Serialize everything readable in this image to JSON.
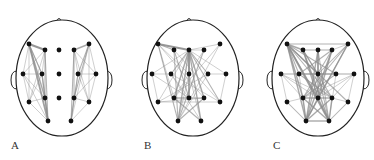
{
  "figure": {
    "panels": [
      {
        "label": "A",
        "label_pos": [
          11,
          139
        ],
        "head": {
          "cx": 62,
          "cy": 78,
          "rx": 46,
          "ry": 58,
          "nose": [
            59,
            19
          ],
          "ears": [
            [
              15,
              80
            ],
            [
              108,
              80
            ]
          ]
        },
        "electrodes": [
          [
            29,
            44
          ],
          [
            45,
            50
          ],
          [
            59,
            50
          ],
          [
            74,
            50
          ],
          [
            89,
            44
          ],
          [
            23,
            74
          ],
          [
            42,
            74
          ],
          [
            59,
            74
          ],
          [
            78,
            74
          ],
          [
            96,
            74
          ],
          [
            29,
            102
          ],
          [
            45,
            98
          ],
          [
            59,
            98
          ],
          [
            74,
            98
          ],
          [
            89,
            102
          ],
          [
            48,
            121
          ],
          [
            71,
            121
          ]
        ],
        "edges": [
          [
            0,
            1,
            3
          ],
          [
            0,
            5,
            1
          ],
          [
            0,
            6,
            1.5
          ],
          [
            0,
            10,
            1
          ],
          [
            0,
            11,
            2
          ],
          [
            0,
            15,
            2.5
          ],
          [
            1,
            5,
            1
          ],
          [
            1,
            6,
            1
          ],
          [
            1,
            11,
            1.5
          ],
          [
            1,
            15,
            1.5
          ],
          [
            5,
            6,
            1
          ],
          [
            5,
            10,
            1
          ],
          [
            5,
            11,
            1
          ],
          [
            5,
            15,
            1
          ],
          [
            6,
            10,
            1
          ],
          [
            6,
            11,
            1
          ],
          [
            6,
            15,
            2
          ],
          [
            10,
            11,
            1
          ],
          [
            10,
            15,
            1
          ],
          [
            11,
            15,
            2
          ],
          [
            0,
            6,
            1
          ],
          [
            1,
            10,
            1
          ],
          [
            4,
            3,
            2
          ],
          [
            4,
            9,
            1
          ],
          [
            4,
            8,
            1.5
          ],
          [
            4,
            14,
            1
          ],
          [
            4,
            13,
            1.5
          ],
          [
            4,
            16,
            1
          ],
          [
            3,
            8,
            1
          ],
          [
            3,
            9,
            1
          ],
          [
            3,
            13,
            1.5
          ],
          [
            3,
            16,
            1.5
          ],
          [
            9,
            8,
            1
          ],
          [
            9,
            14,
            1
          ],
          [
            9,
            13,
            1
          ],
          [
            8,
            14,
            1
          ],
          [
            8,
            13,
            1
          ],
          [
            8,
            16,
            1.5
          ],
          [
            14,
            13,
            1
          ],
          [
            14,
            16,
            1
          ],
          [
            13,
            16,
            1.5
          ],
          [
            3,
            14,
            1
          ]
        ]
      },
      {
        "label": "B",
        "label_pos": [
          144,
          139
        ],
        "head": {
          "cx": 193,
          "cy": 78,
          "rx": 46,
          "ry": 58,
          "nose": [
            189,
            19
          ],
          "ears": [
            [
              146,
              80
            ],
            [
              239,
              80
            ]
          ]
        },
        "electrodes": [
          [
            158,
            44
          ],
          [
            174,
            50
          ],
          [
            189,
            50
          ],
          [
            204,
            50
          ],
          [
            220,
            44
          ],
          [
            152,
            74
          ],
          [
            171,
            74
          ],
          [
            189,
            74
          ],
          [
            208,
            74
          ],
          [
            226,
            74
          ],
          [
            158,
            102
          ],
          [
            174,
            98
          ],
          [
            189,
            98
          ],
          [
            204,
            98
          ],
          [
            220,
            102
          ],
          [
            178,
            121
          ],
          [
            201,
            121
          ]
        ],
        "edges": [
          [
            0,
            2,
            3
          ],
          [
            0,
            1,
            1.5
          ],
          [
            2,
            4,
            1
          ],
          [
            2,
            3,
            1
          ],
          [
            2,
            5,
            1
          ],
          [
            2,
            6,
            1.5
          ],
          [
            2,
            7,
            2
          ],
          [
            2,
            8,
            1.5
          ],
          [
            2,
            9,
            1
          ],
          [
            2,
            10,
            1
          ],
          [
            2,
            11,
            2
          ],
          [
            2,
            12,
            2.5
          ],
          [
            2,
            13,
            2
          ],
          [
            2,
            14,
            1.5
          ],
          [
            2,
            15,
            2
          ],
          [
            2,
            16,
            2
          ],
          [
            0,
            7,
            1
          ],
          [
            0,
            11,
            1
          ],
          [
            0,
            13,
            1
          ],
          [
            0,
            15,
            1.5
          ],
          [
            1,
            12,
            1.5
          ],
          [
            1,
            15,
            1.5
          ],
          [
            1,
            14,
            1
          ],
          [
            3,
            15,
            1.5
          ],
          [
            3,
            11,
            1
          ],
          [
            4,
            11,
            1
          ],
          [
            4,
            15,
            1
          ],
          [
            5,
            6,
            1
          ],
          [
            5,
            10,
            1
          ],
          [
            5,
            12,
            1
          ],
          [
            6,
            14,
            1
          ],
          [
            6,
            12,
            1
          ],
          [
            8,
            9,
            1
          ],
          [
            8,
            10,
            1
          ],
          [
            9,
            14,
            1
          ],
          [
            11,
            12,
            2
          ],
          [
            12,
            13,
            1.5
          ],
          [
            10,
            13,
            1
          ],
          [
            10,
            14,
            1
          ],
          [
            11,
            16,
            1.5
          ],
          [
            13,
            15,
            1.5
          ],
          [
            6,
            16,
            1
          ],
          [
            8,
            15,
            1
          ],
          [
            7,
            15,
            1
          ],
          [
            7,
            16,
            1
          ]
        ]
      },
      {
        "label": "C",
        "label_pos": [
          273,
          139
        ],
        "head": {
          "cx": 318,
          "cy": 78,
          "rx": 46,
          "ry": 58,
          "nose": [
            318,
            19
          ],
          "ears": [
            [
              271,
              80
            ],
            [
              365,
              80
            ]
          ]
        },
        "electrodes": [
          [
            287,
            44
          ],
          [
            303,
            50
          ],
          [
            318,
            50
          ],
          [
            332,
            50
          ],
          [
            348,
            44
          ],
          [
            281,
            74
          ],
          [
            299,
            74
          ],
          [
            318,
            74
          ],
          [
            336,
            74
          ],
          [
            354,
            74
          ],
          [
            287,
            102
          ],
          [
            303,
            98
          ],
          [
            318,
            98
          ],
          [
            332,
            98
          ],
          [
            348,
            102
          ],
          [
            306,
            121
          ],
          [
            329,
            121
          ]
        ],
        "edges": [
          [
            0,
            4,
            1.5
          ],
          [
            0,
            1,
            2
          ],
          [
            1,
            2,
            1.5
          ],
          [
            2,
            3,
            1.5
          ],
          [
            3,
            4,
            1
          ],
          [
            0,
            6,
            1.5
          ],
          [
            0,
            7,
            2
          ],
          [
            0,
            8,
            1.5
          ],
          [
            0,
            11,
            2
          ],
          [
            0,
            12,
            2
          ],
          [
            0,
            13,
            1.5
          ],
          [
            0,
            15,
            2
          ],
          [
            0,
            16,
            2.5
          ],
          [
            0,
            14,
            1.5
          ],
          [
            1,
            7,
            1.5
          ],
          [
            1,
            12,
            2
          ],
          [
            1,
            16,
            2
          ],
          [
            1,
            13,
            1.5
          ],
          [
            2,
            7,
            2
          ],
          [
            2,
            12,
            2
          ],
          [
            2,
            15,
            2
          ],
          [
            2,
            16,
            1.5
          ],
          [
            3,
            6,
            1.5
          ],
          [
            3,
            12,
            2
          ],
          [
            3,
            15,
            2
          ],
          [
            3,
            11,
            1.5
          ],
          [
            4,
            7,
            1.5
          ],
          [
            4,
            11,
            1.5
          ],
          [
            4,
            12,
            1.5
          ],
          [
            4,
            15,
            2
          ],
          [
            5,
            6,
            1
          ],
          [
            6,
            7,
            1.5
          ],
          [
            7,
            8,
            1.5
          ],
          [
            8,
            9,
            1
          ],
          [
            5,
            11,
            1
          ],
          [
            5,
            12,
            1
          ],
          [
            5,
            13,
            1
          ],
          [
            9,
            11,
            1
          ],
          [
            9,
            12,
            1
          ],
          [
            9,
            13,
            1
          ],
          [
            6,
            13,
            1.5
          ],
          [
            8,
            11,
            1.5
          ],
          [
            10,
            11,
            1
          ],
          [
            11,
            12,
            2
          ],
          [
            12,
            13,
            2
          ],
          [
            13,
            14,
            1
          ],
          [
            10,
            15,
            1.5
          ],
          [
            11,
            15,
            2
          ],
          [
            12,
            15,
            2
          ],
          [
            12,
            16,
            2
          ],
          [
            13,
            16,
            2
          ],
          [
            14,
            16,
            1.5
          ],
          [
            15,
            16,
            2
          ],
          [
            11,
            16,
            2
          ],
          [
            13,
            15,
            2
          ],
          [
            6,
            15,
            1
          ],
          [
            8,
            16,
            1
          ],
          [
            7,
            15,
            1.5
          ],
          [
            7,
            16,
            1.5
          ],
          [
            5,
            10,
            1
          ],
          [
            9,
            14,
            1
          ],
          [
            5,
            8,
            1
          ],
          [
            6,
            9,
            1
          ]
        ]
      }
    ],
    "colors": {
      "edge": "#8c8c8c",
      "node": "#111111",
      "outline": "#222222"
    }
  }
}
